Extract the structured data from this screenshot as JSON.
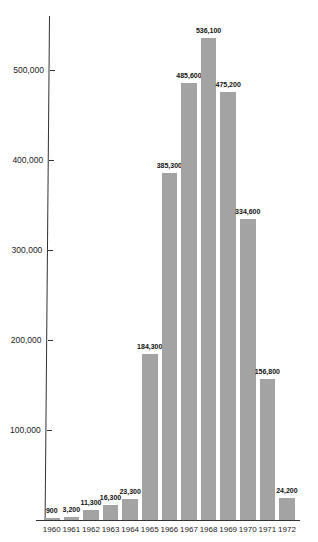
{
  "chart_data": {
    "type": "bar",
    "title": "",
    "xlabel": "",
    "ylabel": "",
    "categories": [
      "1960",
      "1961",
      "1962",
      "1963",
      "1964",
      "1965",
      "1966",
      "1967",
      "1968",
      "1969",
      "1970",
      "1971",
      "1972"
    ],
    "values": [
      900,
      3200,
      11300,
      16300,
      23300,
      184300,
      385300,
      485600,
      536100,
      475200,
      334600,
      156800,
      24200
    ],
    "value_labels": [
      "900",
      "3,200",
      "11,300",
      "16,300",
      "23,300",
      "184,300",
      "385,300",
      "485,600",
      "536,100",
      "475,200",
      "334,600",
      "156,800",
      "24,200"
    ],
    "yticks": [
      100000,
      200000,
      300000,
      400000,
      500000
    ],
    "ytick_labels": [
      "100,000",
      "200,000",
      "300,000",
      "400,000",
      "500,000"
    ],
    "ylim": [
      0,
      560000
    ],
    "grid": false,
    "legend": null,
    "bar_color": "#a3a3a3"
  }
}
